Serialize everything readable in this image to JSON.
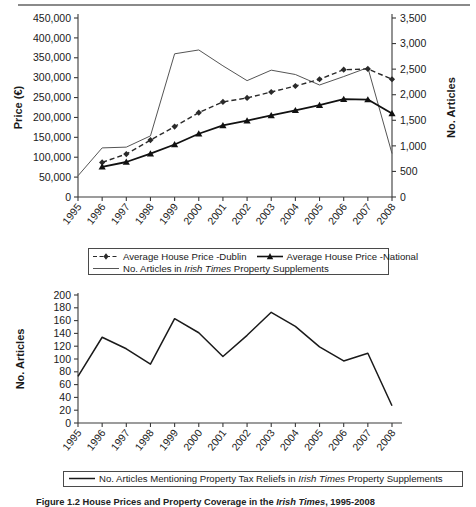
{
  "figure": {
    "caption_prefix": "Figure 1.2",
    "caption_main_a": "House Prices and Property Coverage in the ",
    "caption_italic": "Irish Times",
    "caption_main_b": ", 1995-2008"
  },
  "chart_data": [
    {
      "type": "line",
      "id": "chart-1-house-prices-articles",
      "title": "",
      "xlabel": "",
      "ylabel": "Price (€)",
      "y2label": "No. Articles",
      "grid": false,
      "legend_position": "below",
      "x": [
        "1995",
        "1996",
        "1997",
        "1998",
        "1999",
        "2000",
        "2001",
        "2002",
        "2003",
        "2004",
        "2005",
        "2006",
        "2007",
        "2008"
      ],
      "ylim": [
        0,
        450000
      ],
      "yticks": [
        "0",
        "50,000",
        "100,000",
        "150,000",
        "200,000",
        "250,000",
        "300,000",
        "350,000",
        "400,000",
        "450,000"
      ],
      "ytick_values": [
        0,
        50000,
        100000,
        150000,
        200000,
        250000,
        300000,
        350000,
        400000,
        450000
      ],
      "y2lim": [
        0,
        3500
      ],
      "y2ticks": [
        "0",
        "500",
        "1,000",
        "1,500",
        "2,000",
        "2,500",
        "3,000",
        "3,500"
      ],
      "y2tick_values": [
        0,
        500,
        1000,
        1500,
        2000,
        2500,
        3000,
        3500
      ],
      "series": [
        {
          "name": "Average House Price -Dublin",
          "axis": "left",
          "style": "dashed",
          "marker": "diamond",
          "color": "#2a2a2a",
          "x": [
            "1996",
            "1997",
            "1998",
            "1999",
            "2000",
            "2001",
            "2002",
            "2003",
            "2004",
            "2005",
            "2006",
            "2007",
            "2008"
          ],
          "values": [
            87000,
            108000,
            143000,
            177000,
            212000,
            239000,
            249000,
            264000,
            279000,
            296000,
            320000,
            322000,
            296000
          ]
        },
        {
          "name": "Average House Price -National",
          "axis": "left",
          "style": "solid",
          "marker": "triangle",
          "color": "#111111",
          "x": [
            "1996",
            "1997",
            "1998",
            "1999",
            "2000",
            "2001",
            "2002",
            "2003",
            "2004",
            "2005",
            "2006",
            "2007",
            "2008"
          ],
          "values": [
            76000,
            88000,
            109000,
            132000,
            159000,
            180000,
            192000,
            205000,
            218000,
            231000,
            246000,
            245000,
            210000
          ]
        },
        {
          "name": "No. Articles in Irish Times Property Supplements",
          "axis": "right",
          "style": "thin",
          "marker": "none",
          "color": "#555555",
          "x": [
            "1995",
            "1996",
            "1997",
            "1998",
            "1999",
            "2000",
            "2001",
            "2002",
            "2003",
            "2004",
            "2005",
            "2006",
            "2007",
            "2008"
          ],
          "values": [
            415,
            960,
            975,
            1195,
            2800,
            2875,
            2565,
            2275,
            2480,
            2395,
            2190,
            2355,
            2530,
            850
          ]
        }
      ],
      "legend": [
        {
          "label": "Average House Price -Dublin",
          "style": "dashed-diamond"
        },
        {
          "label": "Average House Price -National",
          "style": "solid-triangle"
        },
        {
          "label_pre": "No. Articles in ",
          "label_italic": "Irish Times",
          "label_post": " Property Supplements",
          "style": "thin-line"
        }
      ]
    },
    {
      "type": "line",
      "id": "chart-2-tax-relief-articles",
      "title": "",
      "xlabel": "",
      "ylabel": "No. Articles",
      "grid": false,
      "legend_position": "below",
      "ylim": [
        0,
        200
      ],
      "yticks": [
        "0",
        "20",
        "40",
        "60",
        "80",
        "100",
        "120",
        "140",
        "160",
        "180",
        "200"
      ],
      "ytick_values": [
        0,
        20,
        40,
        60,
        80,
        100,
        120,
        140,
        160,
        180,
        200
      ],
      "x": [
        "1995",
        "1996",
        "1997",
        "1998",
        "1999",
        "2000",
        "2001",
        "2002",
        "2003",
        "2004",
        "2005",
        "2006",
        "2007",
        "2008"
      ],
      "series": [
        {
          "name": "No. Articles Mentioning Property Tax Reliefs in Irish Times Property Supplements",
          "style": "solid",
          "marker": "none",
          "color": "#1a1a1a",
          "values": [
            73,
            134,
            116,
            92,
            163,
            141,
            104,
            137,
            173,
            151,
            119,
            97,
            109,
            27
          ]
        }
      ],
      "legend": [
        {
          "label_pre": "No. Articles Mentioning Property Tax Reliefs in ",
          "label_italic": "Irish Times",
          "label_post": " Property Supplements",
          "style": "solid-line"
        }
      ]
    }
  ]
}
